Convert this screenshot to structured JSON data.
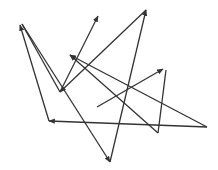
{
  "diagram": {
    "width": 218,
    "height": 170,
    "stroke_color": "#333333",
    "segments": [
      {
        "id": "s1",
        "x1": 49,
        "y1": 121,
        "x2": 20,
        "y2": 25,
        "arrow": "end"
      },
      {
        "id": "s2",
        "x1": 22,
        "y1": 24,
        "x2": 60,
        "y2": 92,
        "arrow": "none"
      },
      {
        "id": "s3",
        "x1": 60,
        "y1": 92,
        "x2": 98,
        "y2": 16,
        "arrow": "end"
      },
      {
        "id": "s4",
        "x1": 146,
        "y1": 10,
        "x2": 60,
        "y2": 92,
        "arrow": "end"
      },
      {
        "id": "s5",
        "x1": 146,
        "y1": 10,
        "x2": 110,
        "y2": 162,
        "arrow": "start"
      },
      {
        "id": "s6",
        "x1": 22,
        "y1": 24,
        "x2": 110,
        "y2": 162,
        "arrow": "end"
      },
      {
        "id": "s7",
        "x1": 207,
        "y1": 127,
        "x2": 49,
        "y2": 121,
        "arrow": "end"
      },
      {
        "id": "s8",
        "x1": 207,
        "y1": 127,
        "x2": 70,
        "y2": 55,
        "arrow": "end"
      },
      {
        "id": "s9",
        "x1": 158,
        "y1": 133,
        "x2": 70,
        "y2": 55,
        "arrow": "end"
      },
      {
        "id": "s10",
        "x1": 97,
        "y1": 107,
        "x2": 163,
        "y2": 69,
        "arrow": "end"
      },
      {
        "id": "s11",
        "x1": 166,
        "y1": 70,
        "x2": 158,
        "y2": 133,
        "arrow": "none"
      }
    ]
  }
}
